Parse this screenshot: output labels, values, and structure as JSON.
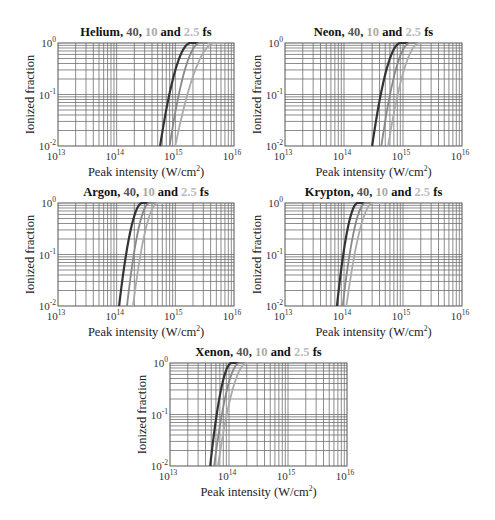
{
  "chart_data": [
    {
      "type": "line",
      "gas": "Helium",
      "title_parts": [
        {
          "text": "Helium, ",
          "color": "#111111"
        },
        {
          "text": "40",
          "color": "#555555"
        },
        {
          "text": ", ",
          "color": "#111111"
        },
        {
          "text": "10",
          "color": "#aaaaaa"
        },
        {
          "text": " and ",
          "color": "#111111"
        },
        {
          "text": "2.5",
          "color": "#bbbbbb"
        },
        {
          "text": " fs",
          "color": "#111111"
        }
      ],
      "xlabel": "Peak intensity (W/cm²)",
      "ylabel": "Ionized fraction",
      "xscale": "log",
      "yscale": "log",
      "xlim": [
        10000000000000.0,
        1e+16
      ],
      "ylim": [
        0.01,
        1
      ],
      "x_ticks": [
        {
          "base": "10",
          "exp": "13"
        },
        {
          "base": "10",
          "exp": "14"
        },
        {
          "base": "10",
          "exp": "15"
        },
        {
          "base": "10",
          "exp": "16"
        }
      ],
      "y_ticks": [
        {
          "base": "10",
          "exp": "0"
        },
        {
          "base": "10",
          "exp": "-1"
        },
        {
          "base": "10",
          "exp": "-2"
        }
      ],
      "grid": true,
      "series": [
        {
          "name": "40 fs",
          "color": "#333333",
          "onset_intensity": 550000000000000.0,
          "saturation_intensity": 1800000000000000.0
        },
        {
          "name": "10 fs",
          "color": "#888888",
          "onset_intensity": 800000000000000.0,
          "saturation_intensity": 2600000000000000.0
        },
        {
          "name": "2.5 fs",
          "color": "#aaaaaa",
          "onset_intensity": 1000000000000000.0,
          "saturation_intensity": 4700000000000000.0
        }
      ]
    },
    {
      "type": "line",
      "gas": "Neon",
      "title_parts": [
        {
          "text": "Neon, ",
          "color": "#111111"
        },
        {
          "text": "40",
          "color": "#555555"
        },
        {
          "text": ", ",
          "color": "#111111"
        },
        {
          "text": "10",
          "color": "#aaaaaa"
        },
        {
          "text": " and ",
          "color": "#111111"
        },
        {
          "text": "2.5",
          "color": "#bbbbbb"
        },
        {
          "text": " fs",
          "color": "#111111"
        }
      ],
      "xlabel": "Peak intensity (W/cm²)",
      "ylabel": "Ionized fraction",
      "xscale": "log",
      "yscale": "log",
      "xlim": [
        10000000000000.0,
        1e+16
      ],
      "ylim": [
        0.01,
        1
      ],
      "x_ticks": [
        {
          "base": "10",
          "exp": "13"
        },
        {
          "base": "10",
          "exp": "14"
        },
        {
          "base": "10",
          "exp": "15"
        },
        {
          "base": "10",
          "exp": "16"
        }
      ],
      "y_ticks": [
        {
          "base": "10",
          "exp": "0"
        },
        {
          "base": "10",
          "exp": "-1"
        },
        {
          "base": "10",
          "exp": "-2"
        }
      ],
      "grid": true,
      "series": [
        {
          "name": "40 fs",
          "color": "#333333",
          "onset_intensity": 300000000000000.0,
          "saturation_intensity": 900000000000000.0
        },
        {
          "name": "10 fs",
          "color": "#888888",
          "onset_intensity": 430000000000000.0,
          "saturation_intensity": 1300000000000000.0
        },
        {
          "name": "2.5 fs",
          "color": "#aaaaaa",
          "onset_intensity": 560000000000000.0,
          "saturation_intensity": 1900000000000000.0
        }
      ]
    },
    {
      "type": "line",
      "gas": "Argon",
      "title_parts": [
        {
          "text": "Argon, ",
          "color": "#111111"
        },
        {
          "text": "40",
          "color": "#555555"
        },
        {
          "text": ", ",
          "color": "#111111"
        },
        {
          "text": "10",
          "color": "#aaaaaa"
        },
        {
          "text": " and ",
          "color": "#111111"
        },
        {
          "text": "2.5",
          "color": "#bbbbbb"
        },
        {
          "text": " fs",
          "color": "#111111"
        }
      ],
      "xlabel": "Peak intensity (W/cm²)",
      "ylabel": "Ionized fraction",
      "xscale": "log",
      "yscale": "log",
      "xlim": [
        10000000000000.0,
        1e+16
      ],
      "ylim": [
        0.01,
        1
      ],
      "x_ticks": [
        {
          "base": "10",
          "exp": "13"
        },
        {
          "base": "10",
          "exp": "14"
        },
        {
          "base": "10",
          "exp": "15"
        },
        {
          "base": "10",
          "exp": "16"
        }
      ],
      "y_ticks": [
        {
          "base": "10",
          "exp": "0"
        },
        {
          "base": "10",
          "exp": "-1"
        },
        {
          "base": "10",
          "exp": "-2"
        }
      ],
      "grid": true,
      "series": [
        {
          "name": "40 fs",
          "color": "#333333",
          "onset_intensity": 110000000000000.0,
          "saturation_intensity": 270000000000000.0
        },
        {
          "name": "10 fs",
          "color": "#888888",
          "onset_intensity": 150000000000000.0,
          "saturation_intensity": 360000000000000.0
        },
        {
          "name": "2.5 fs",
          "color": "#aaaaaa",
          "onset_intensity": 190000000000000.0,
          "saturation_intensity": 500000000000000.0
        }
      ]
    },
    {
      "type": "line",
      "gas": "Krypton",
      "title_parts": [
        {
          "text": "Krypton, ",
          "color": "#111111"
        },
        {
          "text": "40",
          "color": "#555555"
        },
        {
          "text": ", ",
          "color": "#111111"
        },
        {
          "text": "10",
          "color": "#aaaaaa"
        },
        {
          "text": " and ",
          "color": "#111111"
        },
        {
          "text": "2.5",
          "color": "#bbbbbb"
        },
        {
          "text": " fs",
          "color": "#111111"
        }
      ],
      "xlabel": "Peak intensity (W/cm²)",
      "ylabel": "Ionized fraction",
      "xscale": "log",
      "yscale": "log",
      "xlim": [
        10000000000000.0,
        1e+16
      ],
      "ylim": [
        0.01,
        1
      ],
      "x_ticks": [
        {
          "base": "10",
          "exp": "13"
        },
        {
          "base": "10",
          "exp": "14"
        },
        {
          "base": "10",
          "exp": "15"
        },
        {
          "base": "10",
          "exp": "16"
        }
      ],
      "y_ticks": [
        {
          "base": "10",
          "exp": "0"
        },
        {
          "base": "10",
          "exp": "-1"
        },
        {
          "base": "10",
          "exp": "-2"
        }
      ],
      "grid": true,
      "series": [
        {
          "name": "40 fs",
          "color": "#333333",
          "onset_intensity": 76000000000000.0,
          "saturation_intensity": 170000000000000.0
        },
        {
          "name": "10 fs",
          "color": "#888888",
          "onset_intensity": 95000000000000.0,
          "saturation_intensity": 230000000000000.0
        },
        {
          "name": "2.5 fs",
          "color": "#aaaaaa",
          "onset_intensity": 110000000000000.0,
          "saturation_intensity": 310000000000000.0
        }
      ]
    },
    {
      "type": "line",
      "gas": "Xenon",
      "title_parts": [
        {
          "text": "Xenon, ",
          "color": "#111111"
        },
        {
          "text": "40",
          "color": "#555555"
        },
        {
          "text": ", ",
          "color": "#111111"
        },
        {
          "text": "10",
          "color": "#aaaaaa"
        },
        {
          "text": " and ",
          "color": "#111111"
        },
        {
          "text": "2.5",
          "color": "#bbbbbb"
        },
        {
          "text": " fs",
          "color": "#111111"
        }
      ],
      "xlabel": "Peak intensity (W/cm²)",
      "ylabel": "Ionized fraction",
      "xscale": "log",
      "yscale": "log",
      "xlim": [
        10000000000000.0,
        1e+16
      ],
      "ylim": [
        0.01,
        1
      ],
      "x_ticks": [
        {
          "base": "10",
          "exp": "13"
        },
        {
          "base": "10",
          "exp": "14"
        },
        {
          "base": "10",
          "exp": "15"
        },
        {
          "base": "10",
          "exp": "16"
        }
      ],
      "y_ticks": [
        {
          "base": "10",
          "exp": "0"
        },
        {
          "base": "10",
          "exp": "-1"
        },
        {
          "base": "10",
          "exp": "-2"
        }
      ],
      "grid": true,
      "series": [
        {
          "name": "40 fs",
          "color": "#333333",
          "onset_intensity": 48000000000000.0,
          "saturation_intensity": 110000000000000.0
        },
        {
          "name": "10 fs",
          "color": "#888888",
          "onset_intensity": 56000000000000.0,
          "saturation_intensity": 150000000000000.0
        },
        {
          "name": "2.5 fs",
          "color": "#aaaaaa",
          "onset_intensity": 65000000000000.0,
          "saturation_intensity": 200000000000000.0
        }
      ]
    }
  ]
}
